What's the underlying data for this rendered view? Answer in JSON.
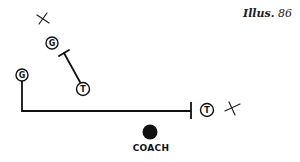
{
  "caption": {
    "label": "Illus.",
    "number": "86"
  },
  "players": [
    {
      "id": "guard-top",
      "letter": "G",
      "cx": 52,
      "cy": 43
    },
    {
      "id": "guard-left",
      "letter": "G",
      "cx": 22,
      "cy": 75
    },
    {
      "id": "tackle-mid",
      "letter": "T",
      "cx": 83,
      "cy": 89
    },
    {
      "id": "tackle-right",
      "letter": "T",
      "cx": 207,
      "cy": 110
    }
  ],
  "marks": [
    {
      "id": "x-top",
      "symbol": "X",
      "cx": 43,
      "cy": 19
    },
    {
      "id": "x-right",
      "symbol": "X",
      "cx": 232,
      "cy": 108
    }
  ],
  "coach": {
    "label": "COACH",
    "cx": 150,
    "cy": 132
  },
  "colors": {
    "ink": "#111111",
    "background": "#ffffff"
  }
}
